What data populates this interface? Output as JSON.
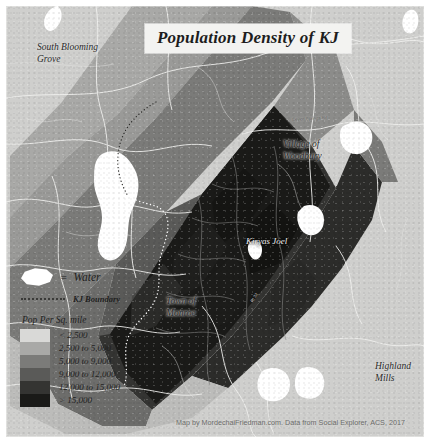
{
  "title": "Population Density of KJ",
  "map": {
    "background_color": "#cfcfcd",
    "water_color": "#ffffff",
    "road_color": "#f2f2f0",
    "boundary_color": "#ffffff"
  },
  "places": [
    {
      "id": "south-blooming-grove",
      "label": "South Blooming\nGrove"
    },
    {
      "id": "village-of-woodbury",
      "label": "Village of\nWoodbury"
    },
    {
      "id": "kiryas-joel",
      "label": "Kiryas Joel"
    },
    {
      "id": "town-of-monroe",
      "label": "Town of\nMonroe"
    },
    {
      "id": "highland-mills",
      "label": "Highland\nMills"
    }
  ],
  "road_labels": [
    {
      "id": "seven-springs-rd",
      "label": "Seven Springs Rd"
    },
    {
      "id": "route-32",
      "label": "Rt 32"
    }
  ],
  "legend": {
    "water_equals": "=",
    "water_label": "Water",
    "boundary_label": "KJ Boundary",
    "ramp_title": "Pop Per Sq. mile",
    "classes": [
      {
        "label": "< 2,500",
        "color": "#d9d9d7"
      },
      {
        "label": "2,500 to 5,000",
        "color": "#a9a9a7"
      },
      {
        "label": "5,000 to 9,000",
        "color": "#7b7b79"
      },
      {
        "label": "9,000 to 12,000",
        "color": "#5a5a58"
      },
      {
        "label": "12,000 to 15,000",
        "color": "#343432"
      },
      {
        "label": "> 15,000",
        "color": "#1a1a18"
      }
    ]
  },
  "attribution": "Map by MordechaiFriedman.com. Data from Social Explorer, ACS, 2017"
}
